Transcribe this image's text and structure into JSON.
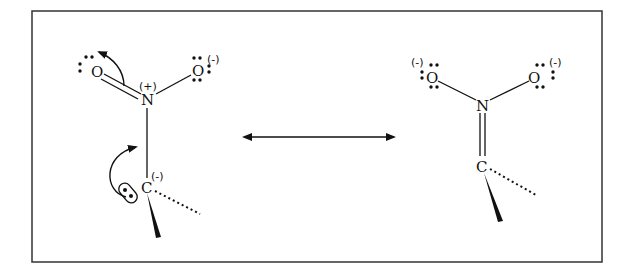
{
  "diagram": {
    "type": "resonance-structures",
    "left_structure": {
      "atoms": {
        "O_double": {
          "label": "O",
          "charge": ""
        },
        "N": {
          "label": "N",
          "charge": "(+)"
        },
        "O_single": {
          "label": "O",
          "charge": "(-)"
        },
        "C": {
          "label": "C",
          "charge": "(-)"
        }
      },
      "bonds": [
        "O=N",
        "N-O",
        "N-C",
        "C-wedge",
        "C-hash"
      ],
      "curved_arrows": [
        "C lone pair to C-N bond",
        "N=O pi bond to O"
      ]
    },
    "resonance_arrow": {
      "symbol": "↔"
    },
    "right_structure": {
      "atoms": {
        "O_left": {
          "label": "O",
          "charge": "(-)"
        },
        "N": {
          "label": "N",
          "charge": ""
        },
        "O_right": {
          "label": "O",
          "charge": "(-)"
        },
        "C": {
          "label": "C",
          "charge": ""
        }
      },
      "bonds": [
        "O-N",
        "N-O",
        "N=C",
        "C-wedge",
        "C-hash"
      ]
    },
    "colors": {
      "ink": "#111111",
      "frame": "#333333",
      "background": "#ffffff"
    }
  }
}
